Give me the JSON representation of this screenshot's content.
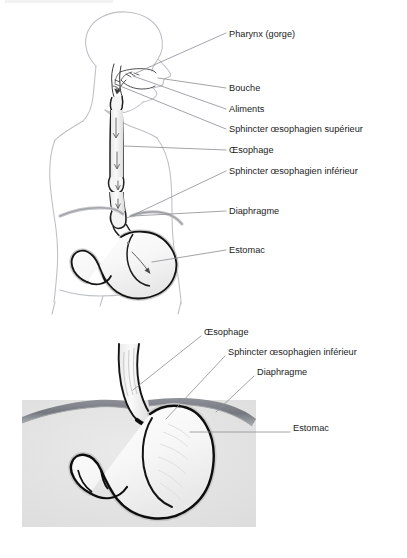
{
  "document": {
    "title": "Anatomie de l'œsophage et de l'estomac",
    "language": "fr",
    "background_color": "#ffffff",
    "text_color": "#1b1b1b"
  },
  "figures": [
    {
      "id": "upper-figure",
      "name": "Trajet des aliments de la bouche à l'estomac",
      "description": "Vue sagittale de la tête, du cou et du tronc montrant le trajet des aliments",
      "labels": [
        {
          "id": "pharynx",
          "text": "Pharynx (gorge)",
          "x": 229,
          "y": 29
        },
        {
          "id": "bouche",
          "text": "Bouche",
          "x": 229,
          "y": 89
        },
        {
          "id": "aliments",
          "text": "Aliments",
          "x": 229,
          "y": 110
        },
        {
          "id": "sphincter-superieur",
          "text": "Sphincter œsophagien supérieur",
          "x": 229,
          "y": 130
        },
        {
          "id": "oesophage",
          "text": "Œsophage",
          "x": 229,
          "y": 151
        },
        {
          "id": "sphincter-inferieur",
          "text": "Sphincter œsophagien inférieur",
          "x": 229,
          "y": 172
        },
        {
          "id": "diaphragme",
          "text": "Diaphragme",
          "x": 229,
          "y": 212
        },
        {
          "id": "estomac",
          "text": "Estomac",
          "x": 229,
          "y": 251
        }
      ]
    },
    {
      "id": "lower-figure",
      "name": "Jonction œso-gastrique en coupe",
      "description": "Coupe agrandie de la jonction entre l'œsophage, le diaphragme et l'estomac",
      "labels": [
        {
          "id": "oesophage-2",
          "text": "Œsophage",
          "x": 204,
          "y": 332
        },
        {
          "id": "sphincter-inferieur-2",
          "text": "Sphincter œsophagien inférieur",
          "x": 228,
          "y": 352
        },
        {
          "id": "diaphragme-2",
          "text": "Diaphragme",
          "x": 257,
          "y": 372
        },
        {
          "id": "estomac-2",
          "text": "Estomac",
          "x": 293,
          "y": 428
        }
      ]
    }
  ],
  "colors": {
    "body_outline": "#b9bcc2",
    "organ_outline": "#1a1a1a",
    "organ_fill": "#f2f2f2",
    "organ_fill_light": "#fbfbfb",
    "diaphragm_band": "#7f8288",
    "panel_background": "#e3e3e3",
    "leader_line": "#8a8d93",
    "shadow_gray": "#c6c6c6"
  }
}
